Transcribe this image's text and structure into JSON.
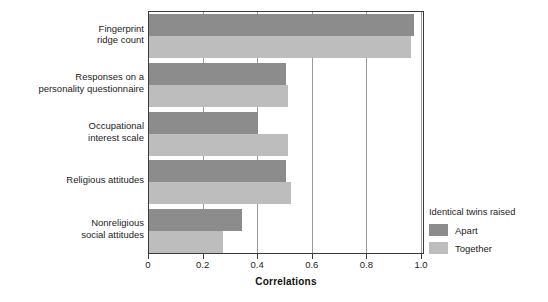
{
  "chart_data": {
    "type": "bar",
    "orientation": "horizontal",
    "title": "",
    "xlabel": "Correlations",
    "ylabel": "",
    "xlim": [
      0,
      1.0
    ],
    "xticks": [
      "0",
      "0.2",
      "0.4",
      "0.6",
      "0.8",
      "1.0"
    ],
    "xtick_values": [
      0,
      0.2,
      0.4,
      0.6,
      0.8,
      1.0
    ],
    "grid": true,
    "grid_axis": "x",
    "legend_position": "right",
    "legend_title": "Identical twins raised",
    "categories": [
      "Fingerprint\nridge count",
      "Responses on a\npersonality questionnaire",
      "Occupational\ninterest scale",
      "Religious attitudes",
      "Nonreligious\nsocial attitudes"
    ],
    "series": [
      {
        "name": "Apart",
        "color": "#8c8c8c",
        "values": [
          0.97,
          0.5,
          0.4,
          0.5,
          0.34
        ]
      },
      {
        "name": "Together",
        "color": "#bdbdbd",
        "values": [
          0.96,
          0.51,
          0.51,
          0.52,
          0.27
        ]
      }
    ]
  },
  "legend": {
    "title": "Identical twins raised",
    "entries": [
      {
        "label": "Apart",
        "color": "#8c8c8c",
        "swatch": "legend-swatch-apart"
      },
      {
        "label": "Together",
        "color": "#bdbdbd",
        "swatch": "legend-swatch-together"
      }
    ]
  },
  "axis": {
    "x_title": "Correlations"
  }
}
